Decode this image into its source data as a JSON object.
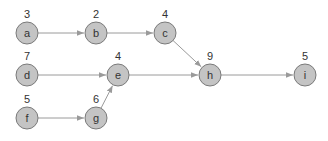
{
  "diagram": {
    "type": "directed-graph",
    "nodes": [
      {
        "id": "a",
        "label": "a",
        "weight": "3",
        "x": 27,
        "y": 33
      },
      {
        "id": "b",
        "label": "b",
        "weight": "2",
        "x": 96,
        "y": 33
      },
      {
        "id": "c",
        "label": "c",
        "weight": "4",
        "x": 165,
        "y": 33
      },
      {
        "id": "d",
        "label": "d",
        "weight": "7",
        "x": 27,
        "y": 75
      },
      {
        "id": "e",
        "label": "e",
        "weight": "4",
        "x": 118,
        "y": 75
      },
      {
        "id": "h",
        "label": "h",
        "weight": "9",
        "x": 210,
        "y": 75
      },
      {
        "id": "i",
        "label": "i",
        "weight": "5",
        "x": 305,
        "y": 75
      },
      {
        "id": "f",
        "label": "f",
        "weight": "5",
        "x": 27,
        "y": 118
      },
      {
        "id": "g",
        "label": "g",
        "weight": "6",
        "x": 96,
        "y": 118
      }
    ],
    "edges": [
      {
        "from": "a",
        "to": "b"
      },
      {
        "from": "b",
        "to": "c"
      },
      {
        "from": "c",
        "to": "h"
      },
      {
        "from": "d",
        "to": "e"
      },
      {
        "from": "e",
        "to": "h"
      },
      {
        "from": "h",
        "to": "i"
      },
      {
        "from": "f",
        "to": "g"
      },
      {
        "from": "g",
        "to": "e"
      }
    ],
    "colors": {
      "node_fill": "#c4c4c4",
      "node_stroke": "#7a7a7a",
      "edge": "#9a9a9a",
      "text": "#333333"
    }
  }
}
